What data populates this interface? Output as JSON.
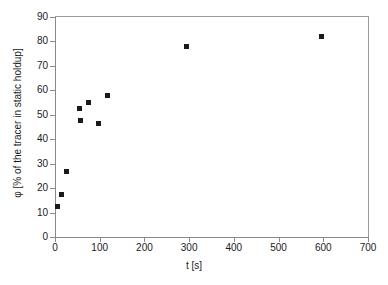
{
  "chart_data": {
    "type": "scatter",
    "title": "",
    "xlabel": "t [s]",
    "ylabel": "φ [% of the tracer in static holdup]",
    "xlim": [
      0,
      700
    ],
    "ylim": [
      0,
      90
    ],
    "xticks": [
      0,
      100,
      200,
      300,
      400,
      500,
      600,
      700
    ],
    "yticks": [
      0,
      10,
      20,
      30,
      40,
      50,
      60,
      70,
      80,
      90
    ],
    "grid": false,
    "legend": null,
    "marker": "filled-square",
    "marker_color": "#1b1b1b",
    "series": [
      {
        "name": "tracer in static holdup",
        "points": [
          {
            "x": 5,
            "y": 12.5
          },
          {
            "x": 15,
            "y": 17.5
          },
          {
            "x": 25,
            "y": 27.0
          },
          {
            "x": 55,
            "y": 52.5
          },
          {
            "x": 57,
            "y": 47.5
          },
          {
            "x": 75,
            "y": 55.0
          },
          {
            "x": 97,
            "y": 46.5
          },
          {
            "x": 117,
            "y": 58.0
          },
          {
            "x": 295,
            "y": 78.0
          },
          {
            "x": 595,
            "y": 82.0
          }
        ]
      }
    ]
  },
  "axes": {
    "x_tick_labels": [
      "0",
      "100",
      "200",
      "300",
      "400",
      "500",
      "600",
      "700"
    ],
    "y_tick_labels": [
      "0",
      "10",
      "20",
      "30",
      "40",
      "50",
      "60",
      "70",
      "80",
      "90"
    ],
    "x_title": "t [s]",
    "y_title": "φ [% of the tracer in static holdup]"
  },
  "artifacts": {
    "scan_edge_text": ""
  }
}
